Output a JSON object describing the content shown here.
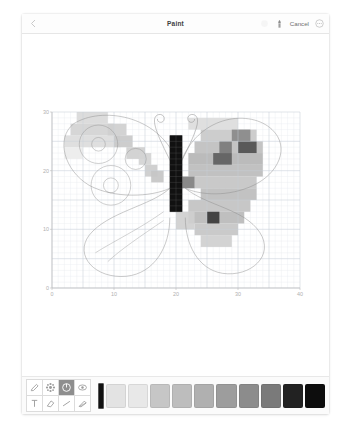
{
  "window": {
    "title": "Paint"
  },
  "titlebar": {
    "back_icon": "chevron-left-icon",
    "actions": [
      {
        "name": "share-icon",
        "label": "",
        "icon": "share-icon",
        "faded": true
      },
      {
        "name": "brush-icon",
        "label": "",
        "icon": "brush-icon",
        "faded": false
      }
    ],
    "cancel_label": "Cancel",
    "more_icon": "more-circle-icon"
  },
  "chart_data": {
    "type": "heatmap",
    "title": "",
    "xlabel": "",
    "ylabel": "",
    "xlim": [
      0,
      40
    ],
    "ylim": [
      0,
      30
    ],
    "xticks": [
      0,
      10,
      20,
      30,
      40
    ],
    "yticks": [
      0,
      10,
      20,
      30
    ],
    "grid": true,
    "cell_size": 1,
    "legend": "none",
    "colors": {
      "background": "#ffffff",
      "grid_minor": "#e8ecf0",
      "grid_major": "#c9d2d9",
      "axis": "#bcbcbc",
      "tick_text": "#b0b0b0",
      "outline": "#8d8d8d",
      "body": "#111111"
    },
    "palette_levels": [
      "#ffffff",
      "#f0f0f0",
      "#e0e0e0",
      "#cfcfcf",
      "#bdbdbd",
      "#a8a8a8",
      "#8f8f8f",
      "#6e6e6e",
      "#4a4a4a",
      "#262626",
      "#111111"
    ],
    "cells": [
      {
        "x": 4,
        "y": 28,
        "w": 5,
        "h": 2,
        "c": "#d9d9d9"
      },
      {
        "x": 3,
        "y": 26,
        "w": 7,
        "h": 2,
        "c": "#d2d2d2"
      },
      {
        "x": 2,
        "y": 24,
        "w": 9,
        "h": 2,
        "c": "#dcdcdc"
      },
      {
        "x": 9,
        "y": 26,
        "w": 3,
        "h": 2,
        "c": "#cfcfcf"
      },
      {
        "x": 10,
        "y": 24,
        "w": 3,
        "h": 2,
        "c": "#c9c9c9"
      },
      {
        "x": 12,
        "y": 22,
        "w": 3,
        "h": 2,
        "c": "#cfcfcf"
      },
      {
        "x": 14,
        "y": 21,
        "w": 2,
        "h": 2,
        "c": "#d4d4d4"
      },
      {
        "x": 15,
        "y": 19,
        "w": 2,
        "h": 2,
        "c": "#cccccc"
      },
      {
        "x": 16,
        "y": 18,
        "w": 2,
        "h": 2,
        "c": "#c6c6c6"
      },
      {
        "x": 2,
        "y": 22,
        "w": 3,
        "h": 2,
        "c": "#ececec"
      },
      {
        "x": 22,
        "y": 27,
        "w": 8,
        "h": 2,
        "c": "#dcdcdc"
      },
      {
        "x": 24,
        "y": 25,
        "w": 9,
        "h": 2,
        "c": "#c9c9c9"
      },
      {
        "x": 23,
        "y": 23,
        "w": 11,
        "h": 2,
        "c": "#bfbfbf"
      },
      {
        "x": 22,
        "y": 21,
        "w": 12,
        "h": 2,
        "c": "#b5b5b5"
      },
      {
        "x": 29,
        "y": 25,
        "w": 3,
        "h": 2,
        "c": "#8a8a8a"
      },
      {
        "x": 30,
        "y": 23,
        "w": 3,
        "h": 2,
        "c": "#4f4f4f"
      },
      {
        "x": 27,
        "y": 23,
        "w": 2,
        "h": 2,
        "c": "#7a7a7a"
      },
      {
        "x": 26,
        "y": 21,
        "w": 3,
        "h": 2,
        "c": "#5e5e5e"
      },
      {
        "x": 22,
        "y": 19,
        "w": 12,
        "h": 2,
        "c": "#bcbcbc"
      },
      {
        "x": 23,
        "y": 17,
        "w": 10,
        "h": 2,
        "c": "#c4c4c4"
      },
      {
        "x": 24,
        "y": 15,
        "w": 9,
        "h": 2,
        "c": "#bdbdbd"
      },
      {
        "x": 22,
        "y": 13,
        "w": 10,
        "h": 2,
        "c": "#c2c2c2"
      },
      {
        "x": 22,
        "y": 11,
        "w": 9,
        "h": 2,
        "c": "#bababa"
      },
      {
        "x": 23,
        "y": 9,
        "w": 7,
        "h": 2,
        "c": "#c6c6c6"
      },
      {
        "x": 24,
        "y": 7,
        "w": 5,
        "h": 2,
        "c": "#cfcfcf"
      },
      {
        "x": 25,
        "y": 11,
        "w": 2,
        "h": 2,
        "c": "#3a3a3a"
      },
      {
        "x": 21,
        "y": 17,
        "w": 2,
        "h": 2,
        "c": "#7f7f7f"
      },
      {
        "x": 20,
        "y": 10,
        "w": 3,
        "h": 3,
        "c": "#cfcfcf"
      },
      {
        "x": 19,
        "y": 13,
        "w": 2,
        "h": 8,
        "c": "#111111"
      },
      {
        "x": 19,
        "y": 21,
        "w": 2,
        "h": 5,
        "c": "#111111"
      }
    ]
  },
  "tools": [
    {
      "name": "tool-pen",
      "icon": "pen-icon",
      "active": false
    },
    {
      "name": "tool-pattern",
      "icon": "grid-pattern-icon",
      "active": false
    },
    {
      "name": "tool-power",
      "icon": "power-icon",
      "active": true
    },
    {
      "name": "tool-eye",
      "icon": "eye-icon",
      "active": false
    },
    {
      "name": "tool-text",
      "icon": "text-icon",
      "active": false
    },
    {
      "name": "tool-eraser",
      "icon": "eraser-icon",
      "active": false
    },
    {
      "name": "tool-line",
      "icon": "line-icon",
      "active": false
    },
    {
      "name": "tool-fill",
      "icon": "fill-icon",
      "active": false
    }
  ],
  "palette": {
    "current_color": "#111111",
    "swatches": [
      "#e3e3e3",
      "#e8e8e8",
      "#c6c6c6",
      "#bdbdbd",
      "#b0b0b0",
      "#9d9d9d",
      "#8c8c8c",
      "#7a7a7a",
      "#222222",
      "#0d0d0d"
    ]
  }
}
